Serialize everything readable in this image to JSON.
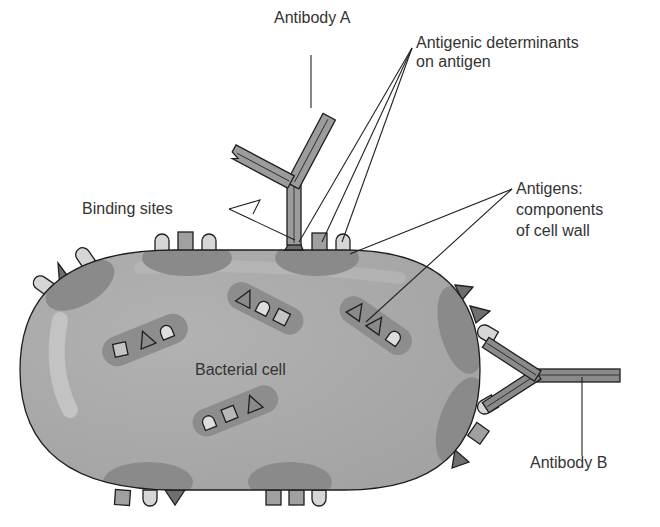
{
  "figure": {
    "type": "diagram"
  },
  "labels": {
    "antibody_a": "Antibody A",
    "antigenic_determinants_line1": "Antigenic determinants",
    "antigenic_determinants_line2": "on antigen",
    "binding_sites": "Binding sites",
    "antigens_line1": "Antigens:",
    "antigens_line2": "components",
    "antigens_line3": "of cell wall",
    "bacterial_cell": "Bacterial cell",
    "antibody_b": "Antibody B"
  },
  "colors": {
    "cell_body": "#a9a9a9",
    "cell_highlight": "#c8c8c8",
    "cell_patch": "#8a8a8a",
    "antigen_square": "#a0a0a0",
    "antigen_dome": "#d6d6d6",
    "antigen_triangle": "#6f6f6f",
    "antibody_fill": "#9c9c9c",
    "antibody_inner": "#7a7a7a",
    "outline": "#1e1e1e"
  }
}
